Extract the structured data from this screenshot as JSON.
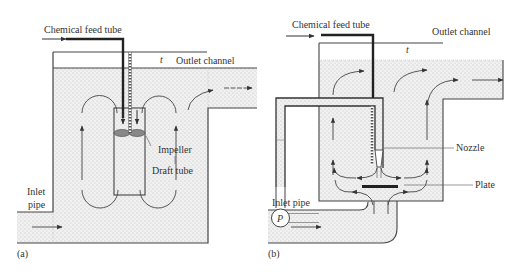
{
  "panel_a": {
    "tag": "(a)",
    "labels": {
      "chemical_feed_tube": "Chemical feed tube",
      "t": "t",
      "outlet_channel": "Outlet channel",
      "impeller": "Impeller",
      "draft_tube": "Draft tube",
      "inlet": "Inlet",
      "pipe": "pipe"
    }
  },
  "panel_b": {
    "tag": "(b)",
    "labels": {
      "chemical_feed_tube": "Chemical feed tube",
      "t": "t",
      "outlet_channel": "Outlet channel",
      "nozzle": "Nozzle",
      "plate": "Plate",
      "inlet_pipe": "Inlet pipe",
      "pump": "P"
    }
  },
  "colors": {
    "fill": "#eeeeee",
    "dots": "#b8b8b8",
    "line": "#444444"
  }
}
